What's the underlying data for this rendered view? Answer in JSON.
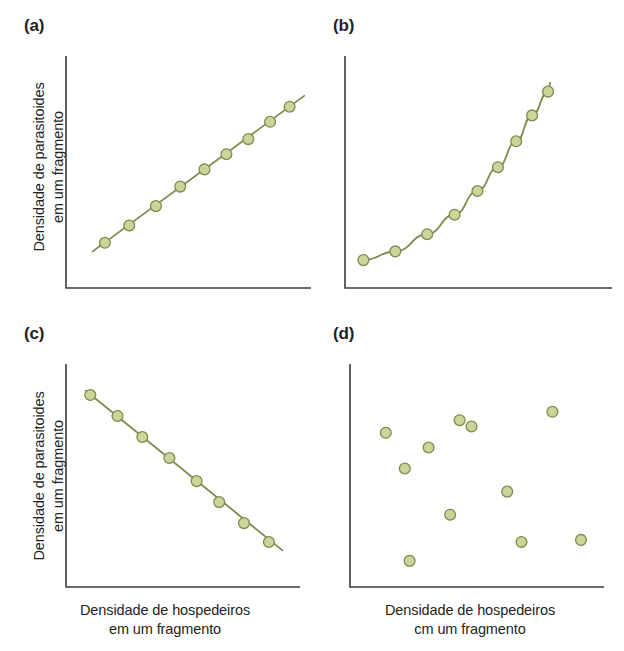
{
  "figure": {
    "axis_color": "#3b3b3b",
    "marker_fill": "#ccd49a",
    "marker_stroke": "#7f8a4c",
    "line_color": "#7f8a4c",
    "background": "#ffffff"
  },
  "labels": {
    "y_axis_line1": "Densidade de parasitoides",
    "y_axis_line2": "em um fragmento",
    "x_axis_line1": "Densidade de hospedeiros",
    "x_axis_line2_c": "em um fragmento",
    "x_axis_line2_d": "cm um fragmento"
  },
  "panels": [
    {
      "id": "a",
      "label": "(a)"
    },
    {
      "id": "b",
      "label": "(b)"
    },
    {
      "id": "c",
      "label": "(c)"
    },
    {
      "id": "d",
      "label": "(d)"
    }
  ],
  "chart_data": [
    {
      "type": "scatter",
      "panel": "(a)",
      "title": "",
      "xlabel": "Densidade de hospedeiros em um fragmento",
      "ylabel": "Densidade de parasitoides em um fragmento",
      "relationship": "positive linear",
      "has_trend_line": true,
      "xlim": [
        0,
        1
      ],
      "ylim": [
        0,
        1
      ],
      "grid": false,
      "x": [
        0.16,
        0.26,
        0.37,
        0.47,
        0.57,
        0.66,
        0.75,
        0.84,
        0.92
      ],
      "y": [
        0.2,
        0.28,
        0.37,
        0.46,
        0.54,
        0.61,
        0.68,
        0.76,
        0.83
      ],
      "line_x": [
        0.11,
        0.98
      ],
      "line_y": [
        0.16,
        0.88
      ]
    },
    {
      "type": "scatter",
      "panel": "(b)",
      "title": "",
      "xlabel": "Densidade de hospedeiros em um fragmento",
      "ylabel": "Densidade de parasitoides em um fragmento",
      "relationship": "positive exponential",
      "has_trend_line": true,
      "xlim": [
        0,
        1
      ],
      "ylim": [
        0,
        1
      ],
      "grid": false,
      "x": [
        0.05,
        0.19,
        0.33,
        0.45,
        0.55,
        0.64,
        0.72,
        0.79,
        0.86
      ],
      "y": [
        0.12,
        0.16,
        0.24,
        0.33,
        0.44,
        0.55,
        0.67,
        0.79,
        0.9
      ],
      "line_x": [
        0.05,
        0.87
      ],
      "line_y": [
        0.12,
        0.93
      ]
    },
    {
      "type": "scatter",
      "panel": "(c)",
      "title": "",
      "xlabel": "Densidade de hospedeiros em um fragmento",
      "ylabel": "Densidade de parasitoides em um fragmento",
      "relationship": "negative linear",
      "has_trend_line": true,
      "xlim": [
        0,
        1
      ],
      "ylim": [
        0,
        1
      ],
      "grid": false,
      "x": [
        0.09,
        0.21,
        0.32,
        0.44,
        0.56,
        0.66,
        0.77,
        0.88
      ],
      "y": [
        0.9,
        0.8,
        0.7,
        0.6,
        0.49,
        0.39,
        0.29,
        0.2
      ],
      "line_x": [
        0.07,
        0.94
      ],
      "line_y": [
        0.92,
        0.16
      ]
    },
    {
      "type": "scatter",
      "panel": "(d)",
      "title": "",
      "xlabel": "Densidade de hospedeiros cm um fragmento",
      "ylabel": "Densidade de parasitoides em um fragmento",
      "relationship": "no relationship (random scatter)",
      "has_trend_line": false,
      "xlim": [
        0,
        1
      ],
      "ylim": [
        0,
        1
      ],
      "grid": false,
      "x": [
        0.1,
        0.18,
        0.2,
        0.28,
        0.37,
        0.41,
        0.46,
        0.61,
        0.67,
        0.8,
        0.92
      ],
      "y": [
        0.72,
        0.55,
        0.11,
        0.65,
        0.33,
        0.78,
        0.75,
        0.44,
        0.2,
        0.82,
        0.21
      ]
    }
  ]
}
